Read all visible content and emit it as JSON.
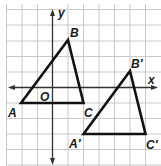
{
  "diagram": {
    "axes": {
      "x_label": "x",
      "y_label": "y",
      "origin_label": "O"
    },
    "grid": {
      "x_min": -3,
      "x_max": 7,
      "y_min": -5,
      "y_max": 5,
      "color": "#c8c8c8"
    },
    "triangle_original": {
      "vertices": [
        {
          "name": "A",
          "x": -3,
          "y": -1
        },
        {
          "name": "B",
          "x": 1,
          "y": 3
        },
        {
          "name": "C",
          "x": 2,
          "y": -1
        }
      ]
    },
    "triangle_image": {
      "vertices": [
        {
          "name": "A′",
          "x": 2,
          "y": -3
        },
        {
          "name": "B′",
          "x": 5,
          "y": 1
        },
        {
          "name": "C′",
          "x": 6,
          "y": -3
        }
      ]
    }
  },
  "labels": {
    "A": "A",
    "B": "B",
    "C": "C",
    "A_prime": "A′",
    "B_prime": "B′",
    "C_prime": "C′",
    "x": "x",
    "y": "y",
    "O": "O"
  }
}
